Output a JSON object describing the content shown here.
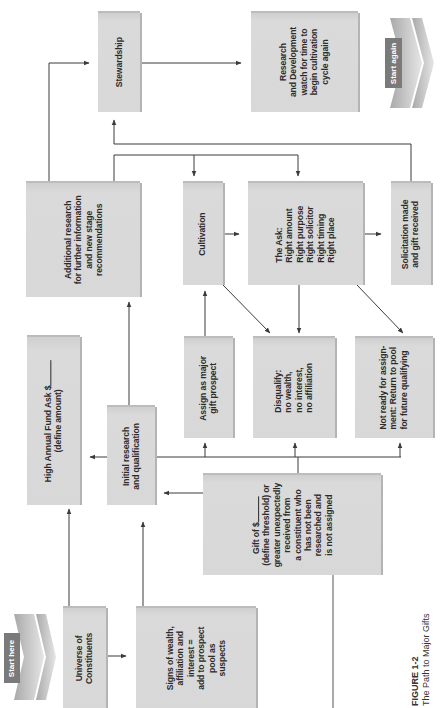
{
  "figure": {
    "number": "FIGURE 1-2",
    "title": "The Path to Major Gifts"
  },
  "colors": {
    "box_fill": "#d8d8d8",
    "box_shadow": "#b4b4b4",
    "line": "#3a3a3a",
    "text": "#2b2b2b",
    "tag_fill": "#7a7a7a"
  },
  "markers": {
    "start": "Start here",
    "end": "Start again"
  },
  "nodes": {
    "universe": {
      "lines": [
        "Universe of",
        "Constituents"
      ]
    },
    "signs": {
      "lines": [
        "Signs of wealth,",
        "affiliation and",
        "interest =",
        "add to prospect",
        "pool as",
        "suspects"
      ]
    },
    "high_annual": {
      "line1": "High Annual Fund Ask $",
      "line2": "(define amount)"
    },
    "initial": {
      "lines": [
        "Initial research",
        "and qualification"
      ]
    },
    "gift": {
      "line1": "Gift of $",
      "lines": [
        "(define threshold) or",
        "greater unexpectedly",
        "received from",
        "a constituent who",
        "has not been",
        "researched and",
        "is not assigned"
      ]
    },
    "assign": {
      "lines": [
        "Assign as major",
        "gift prospect"
      ]
    },
    "disqualify": {
      "lines": [
        "Disqualify:",
        "no wealth,",
        "no interest,",
        "no affiliation"
      ]
    },
    "not_ready": {
      "lines": [
        "Not ready for assign-",
        "ment: Return to pool",
        "for future qualifying"
      ]
    },
    "additional": {
      "lines": [
        "Additional research",
        "for further information",
        "and new stage",
        "recommendations"
      ]
    },
    "cultivation": {
      "lines": [
        "Cultivation"
      ]
    },
    "ask": {
      "lines": [
        "The Ask:",
        "Right amount",
        "Right purpose",
        "Right solicitor",
        "Right timing",
        "Right place"
      ]
    },
    "solicitation": {
      "lines": [
        "Solicitation made",
        "and gift received"
      ]
    },
    "stewardship": {
      "lines": [
        "Stewardship"
      ]
    },
    "rd": {
      "lines": [
        "Research",
        "and Development",
        "watch for time to",
        "begin cultivation",
        "cycle again"
      ]
    }
  }
}
